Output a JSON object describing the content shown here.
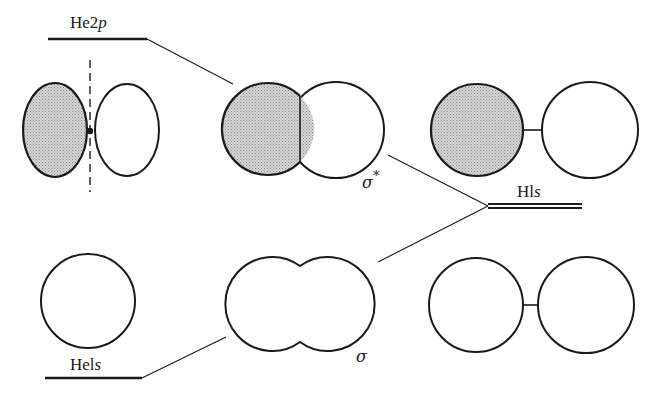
{
  "diagram": {
    "type": "molecular-orbital-correlation",
    "levels": {
      "he2p": {
        "label_main": "He2",
        "label_orbital": "p"
      },
      "h1s": {
        "label_main": "Hl",
        "label_orbital": "s"
      },
      "he1s": {
        "label_main": "Hel",
        "label_orbital": "s"
      }
    },
    "mo_labels": {
      "antibonding": {
        "symbol": "σ",
        "superscript": "*"
      },
      "bonding": {
        "symbol": "σ"
      }
    },
    "colors": {
      "stroke": "#1a1a1a",
      "shade": "#c8c8c8",
      "background": "#ffffff"
    }
  }
}
